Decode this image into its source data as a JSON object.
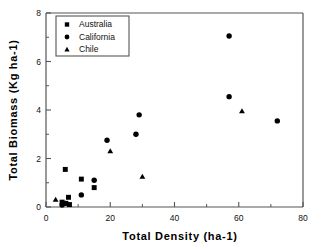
{
  "chart_data": {
    "type": "scatter",
    "title": "",
    "xlabel": "Total  Density  (ha-1)",
    "ylabel": "Total  Biomass  (Kg  ha-1)",
    "xlim": [
      0,
      80
    ],
    "ylim": [
      0,
      8
    ],
    "xticks": [
      "0",
      "20",
      "40",
      "60",
      "80"
    ],
    "xtick_values": [
      0,
      20,
      40,
      60,
      80
    ],
    "yticks": [
      "0",
      "2",
      "4",
      "6",
      "8"
    ],
    "ytick_values": [
      0,
      2,
      4,
      6,
      8
    ],
    "grid": false,
    "legend_position": "upper-left-inside",
    "series": [
      {
        "name": "Australia",
        "marker": "square",
        "color": "#000000",
        "points": [
          {
            "x": 5.0,
            "y": 0.2
          },
          {
            "x": 6.0,
            "y": 1.55
          },
          {
            "x": 6.2,
            "y": 0.15
          },
          {
            "x": 7.0,
            "y": 0.4
          },
          {
            "x": 7.3,
            "y": 0.1
          },
          {
            "x": 11.0,
            "y": 1.15
          },
          {
            "x": 15.0,
            "y": 0.8
          }
        ]
      },
      {
        "name": "California",
        "marker": "circle",
        "color": "#000000",
        "points": [
          {
            "x": 5.0,
            "y": 0.08
          },
          {
            "x": 6.0,
            "y": 0.15
          },
          {
            "x": 11.0,
            "y": 0.5
          },
          {
            "x": 15.0,
            "y": 1.1
          },
          {
            "x": 19.0,
            "y": 2.75
          },
          {
            "x": 28.0,
            "y": 3.0
          },
          {
            "x": 29.0,
            "y": 3.8
          },
          {
            "x": 57.0,
            "y": 7.05
          },
          {
            "x": 57.0,
            "y": 4.55
          },
          {
            "x": 72.0,
            "y": 3.55
          }
        ]
      },
      {
        "name": "Chile",
        "marker": "triangle",
        "color": "#000000",
        "points": [
          {
            "x": 3.0,
            "y": 0.3
          },
          {
            "x": 20.0,
            "y": 2.3
          },
          {
            "x": 30.0,
            "y": 1.25
          },
          {
            "x": 61.0,
            "y": 3.95
          }
        ]
      }
    ]
  },
  "legend": {
    "entries": [
      {
        "label": "Australia",
        "marker": "square"
      },
      {
        "label": "California",
        "marker": "circle"
      },
      {
        "label": "Chile",
        "marker": "triangle"
      }
    ]
  },
  "colors": {
    "marker": "#000000",
    "axis": "#555555",
    "background": "#ffffff",
    "text": "#111111"
  }
}
